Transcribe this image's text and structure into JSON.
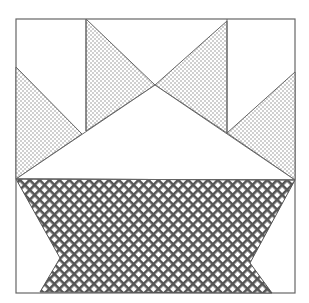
{
  "diagram": {
    "title": "",
    "kind": "quilt-block-pattern",
    "colors": {
      "background": "#ffffff",
      "outline": "#666666",
      "dot_fill": "#8a8a8a",
      "hatch_fill": "#555555"
    },
    "pieces": [
      {
        "id": "top-left-dotted-triangle",
        "fill": "dots"
      },
      {
        "id": "top-center-left-dotted-triangle",
        "fill": "dots"
      },
      {
        "id": "top-center-right-dotted-triangle",
        "fill": "dots"
      },
      {
        "id": "top-right-dotted-triangle",
        "fill": "dots"
      },
      {
        "id": "center-white-triangle",
        "fill": "white"
      },
      {
        "id": "basket-crosshatch",
        "fill": "crosshatch"
      }
    ]
  }
}
